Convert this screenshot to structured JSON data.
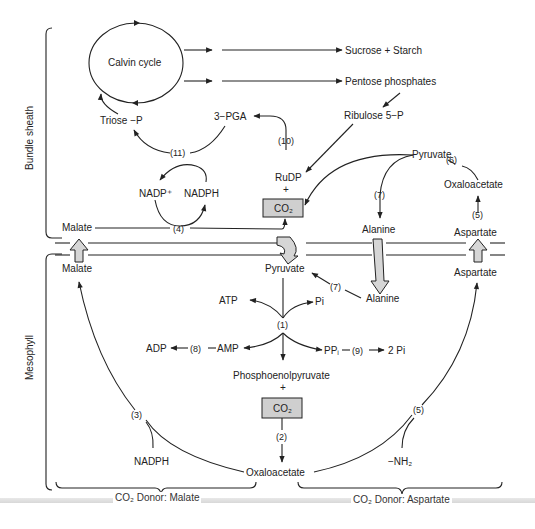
{
  "regions": {
    "bundle_sheath": "Bundle sheath",
    "mesophyll": "Mesophyll"
  },
  "bundle_sheath": {
    "calvin_cycle": "Calvin cycle",
    "sucrose_starch": "Sucrose + Starch",
    "pentose_phosphates": "Pentose phosphates",
    "ribulose_5p": "Ribulose 5−P",
    "triose_p": "Triose −P",
    "pga": "3−PGA",
    "step_10": "(10)",
    "step_11": "(11)",
    "rudp": "RuDP",
    "plus": "+",
    "co2": "CO₂",
    "nadp_plus": "NADP⁺",
    "nadph": "NADPH",
    "malate": "Malate",
    "step_4": "(4)",
    "pyruvate": "Pyruvate",
    "step_6": "(6)",
    "step_7": "(7)",
    "oxaloacetate": "Oxaloacetate",
    "step_5": "(5)",
    "alanine": "Alanine",
    "aspartate": "Aspartate"
  },
  "mesophyll": {
    "malate": "Malate",
    "pyruvate": "Pyruvate",
    "alanine": "Alanine",
    "step_7": "(7)",
    "aspartate": "Aspartate",
    "atp": "ATP",
    "pi": "Pi",
    "step_1": "(1)",
    "adp": "ADP",
    "step_8": "(8)",
    "amp": "AMP",
    "ppi": "PPᵢ",
    "step_9": "(9)",
    "two_pi": "2 Pi",
    "pep": "Phosphoenolpyruvate",
    "plus": "+",
    "co2": "CO₂",
    "step_2": "(2)",
    "oxaloacetate": "Oxaloacetate",
    "step_3": "(3)",
    "nadph": "NADPH",
    "step_5": "(5)",
    "nh2": "−NH₂"
  },
  "footer": {
    "donor_malate": "CO₂ Donor: Malate",
    "donor_aspartate": "CO₂ Donor: Aspartate"
  }
}
